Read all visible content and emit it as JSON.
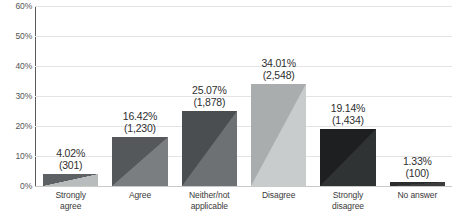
{
  "chart_data": {
    "type": "bar",
    "title": "",
    "xlabel": "",
    "ylabel": "",
    "ylim": [
      0,
      60
    ],
    "ytick_labels": [
      "0%",
      "10%",
      "20%",
      "30%",
      "40%",
      "50%",
      "60%"
    ],
    "ytick_values": [
      0,
      10,
      20,
      30,
      40,
      50,
      60
    ],
    "grid": true,
    "legend": "none",
    "categories": [
      "Strongly agree",
      "Agree",
      "Neither/not applicable",
      "Disagree",
      "Strongly disagree",
      "No answer"
    ],
    "category_lines": [
      [
        "Strongly",
        "agree"
      ],
      [
        "Agree",
        ""
      ],
      [
        "Neither/not",
        "applicable"
      ],
      [
        "Disagree",
        ""
      ],
      [
        "Strongly",
        "disagree"
      ],
      [
        "No answer",
        ""
      ]
    ],
    "values": [
      4.02,
      16.42,
      25.07,
      34.01,
      19.14,
      1.33
    ],
    "counts": [
      301,
      1230,
      1878,
      2548,
      1434,
      100
    ],
    "data_labels": [
      {
        "percent": "4.02%",
        "count": "(301)"
      },
      {
        "percent": "16.42%",
        "count": "(1,230)"
      },
      {
        "percent": "25.07%",
        "count": "(1,878)"
      },
      {
        "percent": "34.01%",
        "count": "(2,548)"
      },
      {
        "percent": "19.14%",
        "count": "(1,434)"
      },
      {
        "percent": "1.33%",
        "count": "(100)"
      }
    ],
    "bar_colors_dark": [
      "#5e6163",
      "#54585b",
      "#4a4e51",
      "#a9adae",
      "#1d1f20",
      "#2a2c2d"
    ],
    "bar_colors_light": [
      "#b9bcbd",
      "#7a7e80",
      "#6d7174",
      "#c9cccd",
      "#303334",
      "#3a3c3d"
    ]
  },
  "axis": {
    "gridline_color": "#e4e4e4",
    "axis_color": "#5a5a5a",
    "baseline_color": "#c9c9c9"
  }
}
